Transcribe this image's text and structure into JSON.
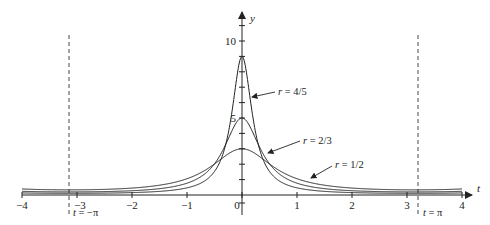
{
  "chart_data": {
    "type": "line",
    "title": "",
    "xlabel": "t",
    "ylabel": "y",
    "xlim": [
      -4,
      4
    ],
    "ylim": [
      0,
      11
    ],
    "grid": false,
    "legend": "inline annotations with arrows",
    "x_ticks": [
      -4,
      -3,
      -2,
      -1,
      0,
      1,
      2,
      3,
      4
    ],
    "x_tick_labels": [
      "−4",
      "−3",
      "−2",
      "−1",
      "0",
      "1",
      "2",
      "3",
      "4"
    ],
    "y_tick_labels": [
      {
        "value": 5,
        "label": "5"
      },
      {
        "value": 10,
        "label": "10"
      }
    ],
    "function": "P_r(t) = (1 - r^2) / (1 - 2 r cos t + r^2)",
    "series": [
      {
        "name": "r = 4/5",
        "r": 0.8,
        "peak": 9,
        "value_at_pi": 0.111,
        "x": [
          -4,
          -3,
          -2,
          -1,
          -0.5,
          -0.25,
          0,
          0.25,
          0.5,
          1,
          2,
          3,
          4
        ],
        "values": [
          0.13,
          0.11,
          0.16,
          0.48,
          1.48,
          4.09,
          9.0,
          4.09,
          1.48,
          0.48,
          0.16,
          0.11,
          0.13
        ]
      },
      {
        "name": "r = 2/3",
        "r": 0.6667,
        "peak": 5,
        "value_at_pi": 0.2,
        "x": [
          -4,
          -3,
          -2,
          -1,
          -0.5,
          -0.25,
          0,
          0.25,
          0.5,
          1,
          2,
          3,
          4
        ],
        "values": [
          0.23,
          0.2,
          0.28,
          0.76,
          1.85,
          3.48,
          5.0,
          3.48,
          1.85,
          0.76,
          0.28,
          0.2,
          0.23
        ]
      },
      {
        "name": "r = 1/2",
        "r": 0.5,
        "peak": 3,
        "value_at_pi": 0.333,
        "x": [
          -4,
          -3,
          -2,
          -1,
          -0.5,
          -0.25,
          0,
          0.25,
          0.5,
          1,
          2,
          3,
          4
        ],
        "values": [
          0.37,
          0.34,
          0.44,
          0.98,
          1.82,
          2.56,
          3.0,
          2.56,
          1.82,
          0.98,
          0.44,
          0.34,
          0.37
        ]
      }
    ],
    "annotations": [
      {
        "text": "r = 4/5",
        "target": "r = 4/5 curve, right side"
      },
      {
        "text": "r = 2/3",
        "target": "r = 2/3 curve, right side"
      },
      {
        "text": "r = 1/2",
        "target": "r = 1/2 curve, right side"
      },
      {
        "text": "t = −π",
        "type": "vertical dashed line",
        "x": -3.14159
      },
      {
        "text": "t = π",
        "type": "vertical dashed line",
        "x": 3.14159
      }
    ]
  },
  "labels": {
    "x_axis": "t",
    "y_axis": "y",
    "y5": "5",
    "y10": "10",
    "r45_var": "r",
    "r45_rest": " = 4/5",
    "r23_var": "r",
    "r23_rest": " = 2/3",
    "r12_var": "r",
    "r12_rest": " = 1/2",
    "neg_pi_var": "t",
    "neg_pi_rest": " = −π",
    "pi_var": "t",
    "pi_rest": " = π"
  }
}
